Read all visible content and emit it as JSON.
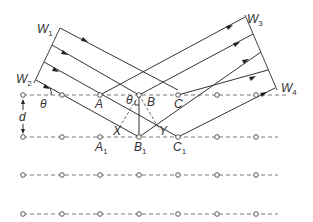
{
  "diagram": {
    "labels": {
      "w1": {
        "main": "W",
        "sub": "1"
      },
      "w2": {
        "main": "W",
        "sub": "2"
      },
      "w3": {
        "main": "W",
        "sub": "3"
      },
      "w4": {
        "main": "W",
        "sub": "4"
      },
      "theta_left": "θ",
      "theta_center": "θ",
      "d": "d",
      "A": "A",
      "B": "B",
      "C": "C",
      "A1": {
        "main": "A",
        "sub": "1"
      },
      "B1": {
        "main": "B",
        "sub": "1"
      },
      "C1": {
        "main": "C",
        "sub": "1"
      },
      "X": "X",
      "Y": "Y"
    },
    "lattice": {
      "rows_y": [
        95,
        137,
        175,
        214
      ],
      "points_x": [
        23,
        62,
        100,
        139,
        178,
        217,
        256
      ],
      "line_start_x": 23,
      "line_end_x": 285
    },
    "colors": {
      "line": "#333333",
      "background": "#ffffff"
    }
  }
}
